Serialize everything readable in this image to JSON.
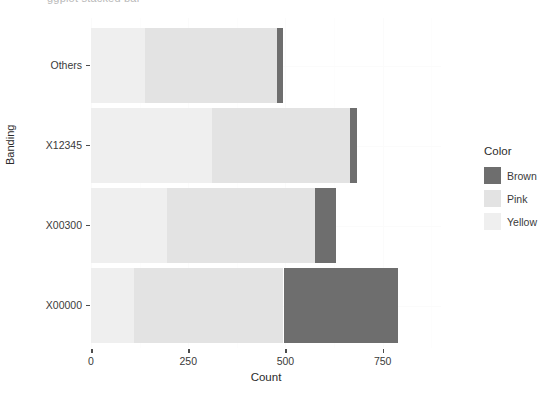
{
  "clipped_title": "ggplot stacked bar",
  "chart_data": {
    "type": "bar",
    "orientation": "horizontal",
    "stacked": true,
    "title": "",
    "xlabel": "Count",
    "ylabel": "Banding",
    "categories": [
      "X00000",
      "X00300",
      "X12345",
      "Others"
    ],
    "category_order_top_to_bottom": [
      "Others",
      "X12345",
      "X00300",
      "X00000"
    ],
    "legend": {
      "title": "Color",
      "position": "right",
      "entries": [
        {
          "label": "Brown",
          "color": "#6e6e6e"
        },
        {
          "label": "Pink",
          "color": "#e3e3e3"
        },
        {
          "label": "Yellow",
          "color": "#efefef"
        }
      ]
    },
    "series": [
      {
        "name": "Yellow",
        "color": "#efefef",
        "values": [
          110,
          196,
          310,
          138
        ]
      },
      {
        "name": "Pink",
        "color": "#e3e3e3",
        "values": [
          385,
          380,
          357,
          341
        ]
      },
      {
        "name": "Brown",
        "color": "#6e6e6e",
        "values": [
          295,
          53,
          18,
          16
        ]
      }
    ],
    "cumulative_totals": [
      790,
      629,
      685,
      495
    ],
    "xlim": [
      0,
      900
    ],
    "x_ticks": [
      0,
      250,
      500,
      750
    ],
    "x_tick_labels": [
      "0",
      "250",
      "500",
      "750"
    ],
    "grid": true
  },
  "axis": {
    "y_title": "Banding",
    "x_title": "Count",
    "y_tick_labels": [
      "Others",
      "X12345",
      "X00300",
      "X00000"
    ],
    "x_tick_labels": [
      "0",
      "250",
      "500",
      "750"
    ]
  },
  "colors": {
    "brown": "#6e6e6e",
    "pink": "#e3e3e3",
    "yellow": "#efefef",
    "panel_bg": "#ffffff",
    "text": "#3a3a3a",
    "grid": "#fbfbfb"
  }
}
